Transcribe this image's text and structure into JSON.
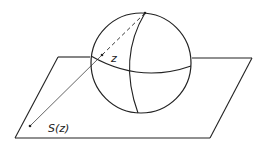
{
  "diagram": {
    "labels": {
      "point_on_sphere": "z",
      "projected_point": "S(z)"
    },
    "colors": {
      "stroke": "#222222",
      "background": "#ffffff"
    }
  }
}
